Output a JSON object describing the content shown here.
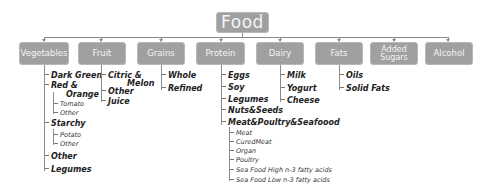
{
  "root": {
    "label": "Food"
  },
  "categories": [
    {
      "label": "Vegetables"
    },
    {
      "label": "Fruit"
    },
    {
      "label": "Grains"
    },
    {
      "label": "Protein"
    },
    {
      "label": "Dairy"
    },
    {
      "label": "Fats"
    },
    {
      "label": "Added Sugars"
    },
    {
      "label": "Alcohol"
    }
  ],
  "vegetables": {
    "dark_green": "Dark Green",
    "red_orange_1": "Red &",
    "red_orange_2": "Orange",
    "tomato": "Tomato",
    "red_other": "Other",
    "starchy": "Starchy",
    "potato": "Potato",
    "starchy_other": "Other",
    "other": "Other",
    "legumes": "Legumes"
  },
  "fruit": {
    "citric_1": "Citric &",
    "citric_2": "Melon",
    "other": "Other",
    "juice": "Juice"
  },
  "grains": {
    "whole": "Whole",
    "refined": "Refined"
  },
  "protein": {
    "eggs": "Eggs",
    "soy": "Soy",
    "legumes": "Legumes",
    "nuts_seeds": "Nuts&Seeds",
    "meat_group": "Meat&Poultry&Seafoood",
    "meat": "Meat",
    "cured_meat": "CuredMeat",
    "organ": "Organ",
    "poultry": "Poultry",
    "seafood_high": "Sea Food High n-3 fatty acids",
    "seafood_low": "Sea Food Low n-3 fatty acids"
  },
  "dairy": {
    "milk": "Milk",
    "yogurt": "Yogurt",
    "cheese": "Cheese"
  },
  "fats": {
    "oils": "Oils",
    "solid_fats": "Solid Fats"
  },
  "colors": {
    "node_fill": "#a0a0a0",
    "node_text": "#f4f4f4",
    "connector": "#8a8a8a",
    "item_text": "#222222"
  }
}
